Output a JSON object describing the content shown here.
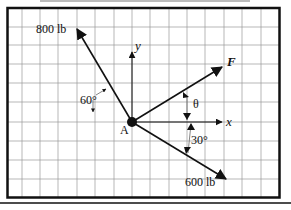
{
  "diagram": {
    "type": "force-vector-diagram",
    "point_label": "A",
    "axes": {
      "x_label": "x",
      "y_label": "y"
    },
    "forces": [
      {
        "id": "force-800",
        "label": "800 lb",
        "angle_note": "60° from negative x-axis (up-left)"
      },
      {
        "id": "force-F",
        "label": "F",
        "angle_note": "θ from positive x-axis (up-right)"
      },
      {
        "id": "force-600",
        "label": "600 lb",
        "angle_note": "30° below positive x-axis"
      }
    ],
    "angles": {
      "a60": "60°",
      "theta": "θ",
      "a30": "30°"
    }
  }
}
